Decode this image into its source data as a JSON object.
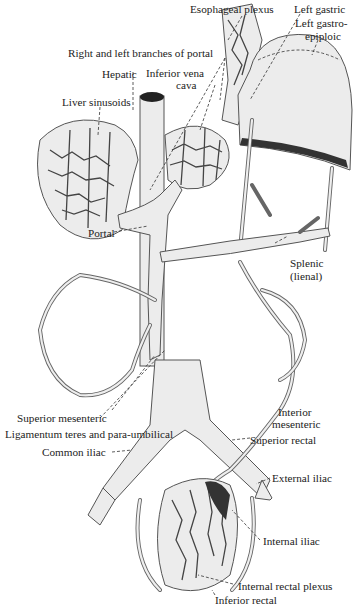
{
  "figure": {
    "colors": {
      "background": "#ffffff",
      "ink": "#222222",
      "vessel_fill": "#ececec",
      "vessel_outline": "#555555"
    }
  },
  "labels": {
    "esophageal_plexus": "Esophageal plexus",
    "left_gastric": "Left gastric",
    "left_gastro_epiploic_1": "Left gastro-",
    "left_gastro_epiploic_2": "epiploic",
    "right_left_branches_portal": "Right and left branches of portal",
    "hepatic": "Hepatic",
    "inferior_vena_cava_1": "Inferior vena",
    "inferior_vena_cava_2": "cava",
    "liver_sinusoids": "Liver sinusoids",
    "portal": "Portal",
    "splenic_1": "Splenic",
    "splenic_2": "(lienal)",
    "superior_mesenteric": "Superior mesenteric",
    "inferior_mesenteric_1": "Interior",
    "inferior_mesenteric_2": "mesenteric",
    "ligamentum_teres": "Ligamentum teres and para-umbilical",
    "superior_rectal": "Superior rectal",
    "common_iliac": "Common iliac",
    "external_iliac": "External iliac",
    "internal_iliac": "Internal iliac",
    "internal_rectal_plexus": "Internal rectal plexus",
    "inferior_rectal": "Inferior rectal"
  }
}
